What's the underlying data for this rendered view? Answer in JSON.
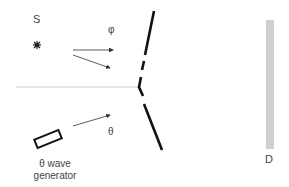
{
  "diagram": {
    "type": "double-slit experiment schematic",
    "labels": {
      "source": "S",
      "phase": "φ",
      "angle": "θ",
      "generator_line1": "θ wave",
      "generator_line2": "generator",
      "detector": "D"
    },
    "colors": {
      "barrier": "#111111",
      "arrows": "#333333",
      "axis": "#bbbbbb",
      "detector": "#888888",
      "text": "#444444"
    },
    "components": [
      {
        "id": "source",
        "label": "S",
        "icon": "star-burst-icon"
      },
      {
        "id": "barrier",
        "label": "",
        "description": "barrier with two slits"
      },
      {
        "id": "wave-generator",
        "label": "θ wave generator",
        "icon": "rectangle"
      },
      {
        "id": "detector",
        "label": "D",
        "description": "screen of parallel lines"
      }
    ]
  }
}
